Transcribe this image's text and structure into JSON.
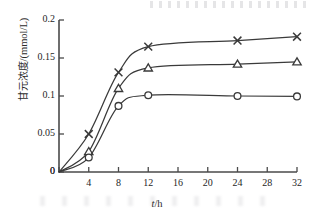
{
  "chart_data": {
    "type": "line",
    "title": "",
    "subtitle": "",
    "xlabel": "t/h",
    "ylabel": "甘元浓度/(mmol/L)",
    "ylabel_cjk": "甘元浓度",
    "ylabel_unit": "/(mmol/L)",
    "xlim": [
      0,
      32
    ],
    "ylim": [
      0,
      0.2
    ],
    "xticks": [
      0,
      4,
      8,
      12,
      16,
      20,
      24,
      28,
      32
    ],
    "xticklabels": [
      "0",
      "4",
      "8",
      "12",
      "16",
      "20",
      "24",
      "28",
      "32"
    ],
    "yticks": [
      0,
      0.05,
      0.1,
      0.15,
      0.2
    ],
    "yticklabels": [
      "0",
      "0.05",
      "0.1",
      "0.15",
      "0.2"
    ],
    "grid": false,
    "legend": "none",
    "x": [
      0,
      4,
      8,
      12,
      24,
      32
    ],
    "series": [
      {
        "name": "cross-series",
        "marker": "x",
        "color": "#3a3a3a",
        "values": [
          0,
          0.05,
          0.131,
          0.165,
          0.173,
          0.178
        ]
      },
      {
        "name": "triangle-series",
        "marker": "triangle",
        "color": "#3a3a3a",
        "values": [
          0,
          0.027,
          0.11,
          0.137,
          0.142,
          0.145
        ]
      },
      {
        "name": "circle-series",
        "marker": "circle",
        "color": "#3a3a3a",
        "values": [
          0,
          0.019,
          0.087,
          0.101,
          0.1,
          0.0995
        ]
      }
    ]
  },
  "axes": {
    "x_title": "t/h",
    "x_title_italic": "t",
    "x_title_rest": "/h"
  }
}
